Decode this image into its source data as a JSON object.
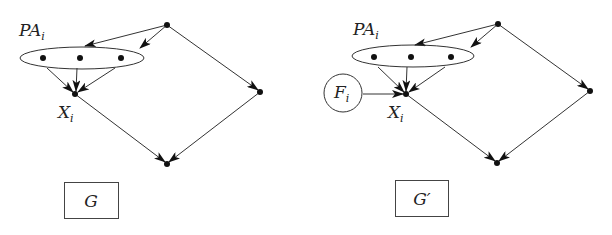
{
  "diagrams": [
    {
      "id": "G",
      "caption": "G",
      "parent_set_label": "PA",
      "parent_set_subscript": "i",
      "target_label": "X",
      "target_subscript": "i"
    },
    {
      "id": "G-prime",
      "caption": "G′",
      "parent_set_label": "PA",
      "parent_set_subscript": "i",
      "target_label": "X",
      "target_subscript": "i",
      "intervention_label": "F",
      "intervention_subscript": "i"
    }
  ],
  "colors": {
    "stroke": "#333333",
    "node": "#111111"
  }
}
